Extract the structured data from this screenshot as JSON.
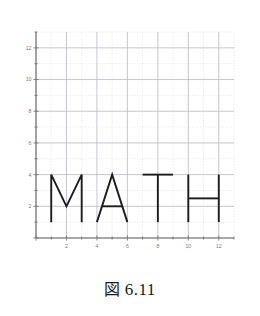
{
  "caption": {
    "figure_word": "図",
    "number": "6.11",
    "full": "図 6.11"
  },
  "chart_data": {
    "type": "line",
    "title": "",
    "subtitle": "",
    "xlabel": "",
    "ylabel": "",
    "xlim": [
      0,
      13
    ],
    "ylim": [
      0,
      13
    ],
    "grid": true,
    "grid_major_step": 2,
    "grid_minor_step": 1,
    "legend_position": "none",
    "xticks": [
      2,
      4,
      6,
      8,
      10,
      12
    ],
    "xtick_labels": [
      "2",
      "4",
      "6",
      "8",
      "10",
      "12"
    ],
    "yticks": [
      2,
      4,
      6,
      8,
      10,
      12
    ],
    "ytick_labels": [
      "2",
      "4",
      "6",
      "8",
      "10",
      "12"
    ],
    "annotation": "The word MATH drawn with straight line segments on the coordinate plane",
    "series": [
      {
        "name": "M",
        "type": "polyline",
        "points": [
          [
            1,
            1
          ],
          [
            1,
            4
          ],
          [
            2,
            2
          ],
          [
            3,
            4
          ],
          [
            3,
            1
          ]
        ]
      },
      {
        "name": "A",
        "type": "polyline",
        "points": [
          [
            4,
            1
          ],
          [
            5,
            4
          ],
          [
            6,
            1
          ]
        ]
      },
      {
        "name": "A-crossbar",
        "type": "polyline",
        "points": [
          [
            4.35,
            2
          ],
          [
            5.65,
            2
          ]
        ]
      },
      {
        "name": "T-top",
        "type": "polyline",
        "points": [
          [
            7,
            4
          ],
          [
            9,
            4
          ]
        ]
      },
      {
        "name": "T-stem",
        "type": "polyline",
        "points": [
          [
            8,
            4
          ],
          [
            8,
            1
          ]
        ]
      },
      {
        "name": "H-left",
        "type": "polyline",
        "points": [
          [
            10,
            4
          ],
          [
            10,
            1
          ]
        ]
      },
      {
        "name": "H-crossbar",
        "type": "polyline",
        "points": [
          [
            10,
            2.5
          ],
          [
            12,
            2.5
          ]
        ]
      },
      {
        "name": "H-right",
        "type": "polyline",
        "points": [
          [
            12,
            4
          ],
          [
            12,
            1
          ]
        ]
      }
    ]
  },
  "colors": {
    "letter_stroke": "#1c1c1c",
    "axis": "#6f6f6f",
    "grid_major": "#b9b9c4",
    "grid_minor": "#d8d8de",
    "tick_label": "#7a7a82",
    "background": "#ffffff"
  }
}
